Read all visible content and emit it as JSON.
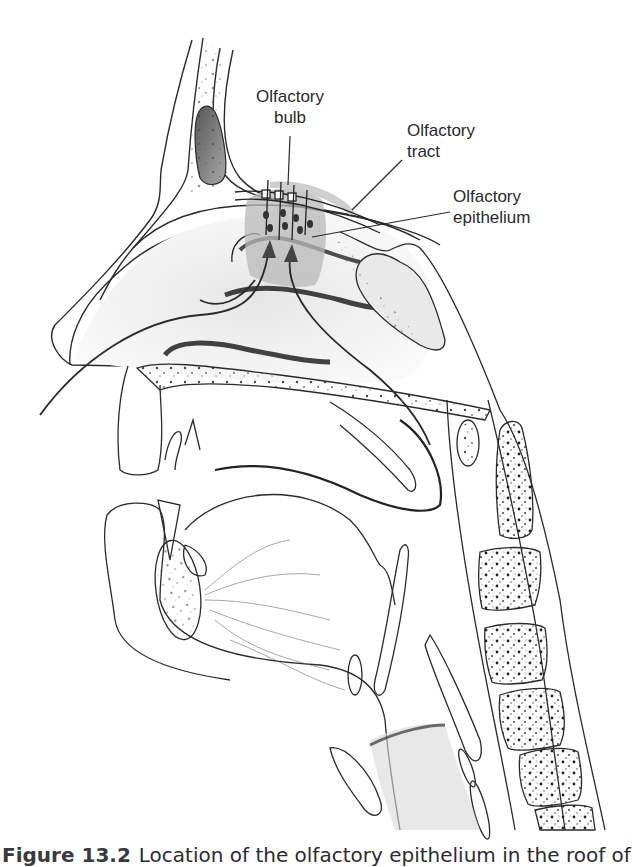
{
  "figure": {
    "type": "anatomical sagittal section of head",
    "labels": [
      {
        "id": "olfactory-bulb",
        "line1": "Olfactory",
        "line2": "bulb"
      },
      {
        "id": "olfactory-tract",
        "line1": "Olfactory",
        "line2": "tract"
      },
      {
        "id": "olfactory-epithelium",
        "line1": "Olfactory",
        "line2": "epithelium"
      }
    ],
    "caption": {
      "number": "Figure 13.2",
      "text": "Location of the olfactory epithelium in the roof of"
    },
    "colors": {
      "line": "#2a2a2a",
      "epithelium_highlight": "#b8b8b8",
      "stipple": "#555555"
    }
  }
}
